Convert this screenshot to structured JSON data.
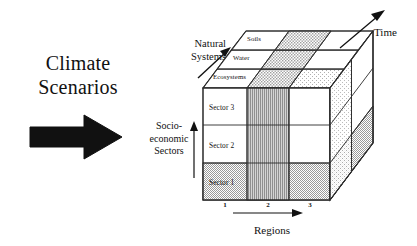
{
  "figure": {
    "kind": "three-dimensional-matrix-diagram",
    "background_color": "#ffffff",
    "ink_color": "#111111"
  },
  "climate": {
    "title": "Climate\nScenarios",
    "arrow_name": "climate-scenarios-arrow",
    "arrow_direction": "right"
  },
  "axes": {
    "natural_systems": {
      "label": "Natural\nSystems",
      "arrow_direction": "up-right"
    },
    "socio_economic": {
      "label": "Socio-\neconomic\nSectors",
      "arrow_direction": "up"
    },
    "time": {
      "label": "Time",
      "arrow_direction": "up-right"
    },
    "regions": {
      "label": "Regions",
      "arrow_direction": "right",
      "ticks": [
        "1",
        "2",
        "3"
      ]
    }
  },
  "cube": {
    "top_face_bands": [
      {
        "label": "Soils"
      },
      {
        "label": "Water"
      },
      {
        "label": "Ecosystems"
      }
    ],
    "front_face_rows": [
      {
        "label": "Sector 3"
      },
      {
        "label": "Sector 2"
      },
      {
        "label": "Sector 1"
      }
    ],
    "front_face_columns": [
      "1",
      "2",
      "3"
    ],
    "shading": {
      "region2_column": "vertical-hatch",
      "sector1_row": "stipple-gray",
      "right_face_bottom": "stipple-gray",
      "top_middle_band": "stipple-gray",
      "plain": "white"
    }
  },
  "colors": {
    "ink": "#111111",
    "line": "#2a2a2a",
    "stipple_gray": "#b9b9b9",
    "hatch_gray": "#a8a8a8",
    "light_stipple": "#e2e2e2",
    "white": "#ffffff"
  }
}
